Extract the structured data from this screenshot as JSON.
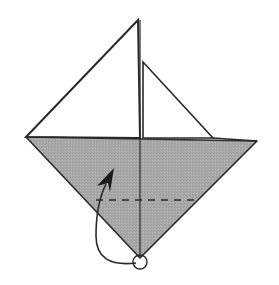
{
  "diagram": {
    "title": "Origami fold step: fold bottom point up along dashed line",
    "type": "origami-instruction",
    "colors": {
      "background": "#ffffff",
      "paper_back": "#a8a8a8",
      "paper_front": "#ffffff",
      "line": "#2a2a2a"
    },
    "elements": {
      "base_triangle": "gray folded base (inverted triangle)",
      "large_sail": "white large triangle flap",
      "small_sail": "white small triangle flap",
      "center_crease": "vertical center crease line",
      "valley_fold": "dashed valley fold line",
      "fold_arrow": "curved arrow from bottom point upward",
      "target_circle": "circle marking the bottom point"
    }
  }
}
